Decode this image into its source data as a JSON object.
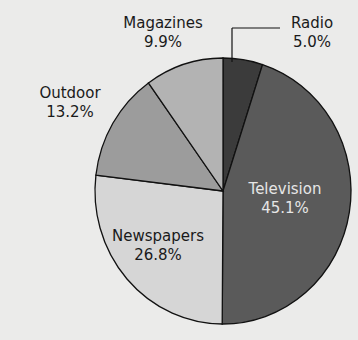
{
  "chart_data": {
    "type": "pie",
    "title": "",
    "slices": [
      {
        "label": "Radio",
        "value": 5.0,
        "display": "5.0%",
        "color": "#3b3b3b"
      },
      {
        "label": "Television",
        "value": 45.1,
        "display": "45.1%",
        "color": "#5a5a5a"
      },
      {
        "label": "Newspapers",
        "value": 26.8,
        "display": "26.8%",
        "color": "#d6d6d6"
      },
      {
        "label": "Outdoor",
        "value": 13.2,
        "display": "13.2%",
        "color": "#9c9c9c"
      },
      {
        "label": "Magazines",
        "value": 9.9,
        "display": "9.9%",
        "color": "#b3b3b3"
      }
    ],
    "start_angle": "12 o'clock, clockwise",
    "legend": "none (direct labels)"
  }
}
